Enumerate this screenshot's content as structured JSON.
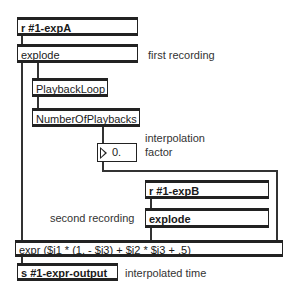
{
  "objects": {
    "recv_a": "r #1-expA",
    "explode_a": "explode",
    "playback_loop": "PlaybackLoop",
    "number_of_playbacks": "NumberOfPlaybacks",
    "number_box_value": "0.",
    "recv_b": "r #1-expB",
    "explode_b": "explode",
    "expr": "expr ($i1 * (1. - $i3) + $i2 * $i3 + .5)",
    "send_output": "s #1-expr-output"
  },
  "comments": {
    "first_recording": "first  recording",
    "interpolation_line1": "interpolation",
    "interpolation_line2": "factor",
    "second_recording": "second recording",
    "interpolated_time": "interpolated  time"
  }
}
